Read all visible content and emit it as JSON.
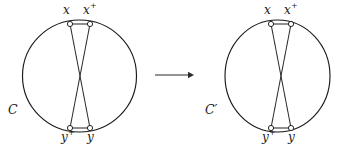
{
  "figure": {
    "width": 346,
    "height": 153,
    "background_color": "#ffffff",
    "stroke_color": "#1a1a1a",
    "node_fill_color": "#ffffff"
  },
  "panels": [
    {
      "id": "left",
      "curve_label": "C",
      "curve_label_prime": "",
      "curve_label_full": "C",
      "circle": {
        "cx": 79.5,
        "cy": 76,
        "rx": 57,
        "ry": 56
      },
      "crossing_point": {
        "x": 80,
        "y": 76
      },
      "nodes": [
        {
          "id": "x",
          "label": "x",
          "superscript": "",
          "x": 70,
          "y": 24,
          "label_x": 63,
          "label_y": 4,
          "position": "top-left"
        },
        {
          "id": "x-plus",
          "label": "x",
          "superscript": "+",
          "x": 90,
          "y": 24,
          "label_x": 84,
          "label_y": 4,
          "position": "top-right"
        },
        {
          "id": "y-plus",
          "label": "y",
          "superscript": "+",
          "x": 70,
          "y": 128,
          "label_x": 62,
          "label_y": 131,
          "position": "bottom-left"
        },
        {
          "id": "y",
          "label": "y",
          "superscript": "",
          "x": 90,
          "y": 128,
          "label_x": 87,
          "label_y": 131,
          "position": "bottom-right"
        }
      ],
      "chords": [
        {
          "id": "chord-x-to-y",
          "from": "x",
          "to": "y"
        },
        {
          "id": "chord-xplus-to-yplus",
          "from": "x-plus",
          "to": "y-plus"
        }
      ]
    },
    {
      "id": "right",
      "curve_label": "C",
      "curve_label_prime": "′",
      "curve_label_full": "C′",
      "circle": {
        "cx": 277.5,
        "cy": 76,
        "rx": 52.5,
        "ry": 56
      },
      "crossing_point": {
        "x": 281,
        "y": 79
      },
      "nodes": [
        {
          "id": "x",
          "label": "x",
          "superscript": "",
          "x": 271,
          "y": 24,
          "label_x": 264,
          "label_y": 4,
          "position": "top-left"
        },
        {
          "id": "x-plus",
          "label": "x",
          "superscript": "+",
          "x": 291,
          "y": 24,
          "label_x": 285,
          "label_y": 4,
          "position": "top-right"
        },
        {
          "id": "y-plus",
          "label": "y",
          "superscript": "+",
          "x": 271,
          "y": 128,
          "label_x": 263,
          "label_y": 131,
          "position": "bottom-left"
        },
        {
          "id": "y",
          "label": "y",
          "superscript": "",
          "x": 291,
          "y": 128,
          "label_x": 288,
          "label_y": 131,
          "position": "bottom-right"
        }
      ],
      "chords": [
        {
          "id": "chord-x-to-y",
          "from": "x",
          "to": "y"
        },
        {
          "id": "chord-xplus-to-yplus",
          "from": "x-plus",
          "to": "y-plus"
        }
      ]
    }
  ],
  "arrow": {
    "glyph": "→",
    "x1": 155,
    "x2": 192,
    "y": 75,
    "color": "#2b2b2b"
  },
  "labels": {
    "left_curve": "C",
    "right_curve": "C′",
    "node_x": "x",
    "node_x_plus": "x+",
    "node_y": "y",
    "node_y_plus": "y+",
    "superscript_plus": "+",
    "prime": "′"
  }
}
